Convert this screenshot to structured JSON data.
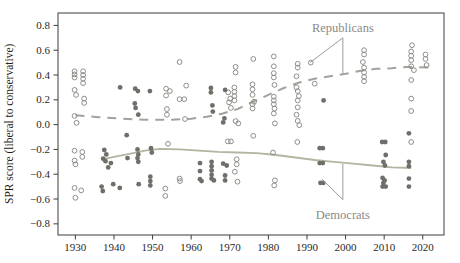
{
  "figure": {
    "background": "#ffffff"
  },
  "chart_data": {
    "type": "scatter",
    "title": "",
    "xlabel": "",
    "ylabel": "SPR score (liberal to conservative)",
    "xlim": [
      1925.5,
      2025.5
    ],
    "ylim": [
      -0.89,
      0.9
    ],
    "grid": false,
    "x_ticks": [
      1930,
      1940,
      1950,
      1960,
      1970,
      1980,
      1990,
      2000,
      2010,
      2020
    ],
    "x_tick_labels": [
      "1930",
      "1940",
      "1950",
      "1960",
      "1970",
      "1980",
      "1990",
      "2000",
      "2010",
      "2020"
    ],
    "y_ticks": [
      0.8,
      0.6,
      0.4,
      0.2,
      0.0,
      -0.2,
      -0.4,
      -0.6,
      -0.8
    ],
    "y_tick_labels": [
      "0.8",
      "0.6",
      "0.4",
      "0.2",
      "0.0",
      "−0.2",
      "−0.4",
      "−0.6",
      "−0.8"
    ],
    "colors": {
      "frame": "#3c3c3a",
      "tick_text": "#2a2a28",
      "republican_marker": "#8e8e89",
      "democrat_marker": "#6f6f69",
      "republican_trend": "#a2a29c",
      "democrat_trend": "#b2b5a1",
      "annotation_text": "#8a8a84",
      "leader_line": "#9b9b96"
    },
    "series": [
      {
        "name": "Republicans",
        "marker": "open-circle",
        "trend_style": "dashed",
        "points": [
          [
            1929.8,
            0.43
          ],
          [
            1929.8,
            0.405
          ],
          [
            1929.8,
            0.38
          ],
          [
            1929.8,
            0.28
          ],
          [
            1930.2,
            0.24
          ],
          [
            1929.8,
            0.07
          ],
          [
            1930.3,
            0.015
          ],
          [
            1929.8,
            -0.21
          ],
          [
            1929.8,
            -0.29
          ],
          [
            1930.0,
            -0.32
          ],
          [
            1929.8,
            -0.51
          ],
          [
            1930.0,
            -0.59
          ],
          [
            1932.0,
            0.43
          ],
          [
            1932.0,
            0.4
          ],
          [
            1932.0,
            0.37
          ],
          [
            1932.0,
            0.335
          ],
          [
            1932.3,
            0.21
          ],
          [
            1932.3,
            0.175
          ],
          [
            1931.8,
            -0.22
          ],
          [
            1931.8,
            -0.26
          ],
          [
            1931.5,
            -0.53
          ],
          [
            1953.5,
            0.29
          ],
          [
            1954.5,
            0.27
          ],
          [
            1953.5,
            0.235
          ],
          [
            1953.7,
            0.125
          ],
          [
            1953.7,
            0.08
          ],
          [
            1954.0,
            -0.155
          ],
          [
            1953.3,
            -0.515
          ],
          [
            1953.3,
            -0.575
          ],
          [
            1957.0,
            0.505
          ],
          [
            1958.7,
            0.315
          ],
          [
            1957.0,
            0.205
          ],
          [
            1958.2,
            0.205
          ],
          [
            1958.4,
            0.045
          ],
          [
            1957.0,
            -0.435
          ],
          [
            1957.1,
            -0.455
          ],
          [
            1969.6,
            0.26
          ],
          [
            1970.1,
            0.21
          ],
          [
            1969.8,
            0.18
          ],
          [
            1970.3,
            0.135
          ],
          [
            1971.5,
            0.028
          ],
          [
            1969.5,
            -0.135
          ],
          [
            1970.3,
            -0.135
          ],
          [
            1971.5,
            0.465
          ],
          [
            1971.5,
            0.42
          ],
          [
            1971.2,
            0.3
          ],
          [
            1971.2,
            0.265
          ],
          [
            1971.2,
            0.23
          ],
          [
            1971.2,
            0.195
          ],
          [
            1972.2,
            0.01
          ],
          [
            1971.8,
            -0.28
          ],
          [
            1971.8,
            -0.32
          ],
          [
            1971.3,
            -0.38
          ],
          [
            1972.0,
            -0.46
          ],
          [
            1976.1,
            0.53
          ],
          [
            1975.9,
            0.325
          ],
          [
            1975.9,
            0.285
          ],
          [
            1975.9,
            0.24
          ],
          [
            1976.3,
            0.185
          ],
          [
            1975.9,
            0.165
          ],
          [
            1975.9,
            0.13
          ],
          [
            1976.1,
            -0.09
          ],
          [
            1981.4,
            0.55
          ],
          [
            1981.4,
            0.47
          ],
          [
            1981.4,
            0.415
          ],
          [
            1981.4,
            0.38
          ],
          [
            1981.6,
            0.32
          ],
          [
            1981.4,
            0.225
          ],
          [
            1981.4,
            0.195
          ],
          [
            1981.4,
            0.165
          ],
          [
            1981.6,
            0.13
          ],
          [
            1981.4,
            0.09
          ],
          [
            1981.7,
            0.01
          ],
          [
            1981.2,
            -0.225
          ],
          [
            1981.7,
            -0.45
          ],
          [
            1981.5,
            -0.49
          ],
          [
            1987.6,
            0.49
          ],
          [
            1987.6,
            0.46
          ],
          [
            1987.3,
            0.39
          ],
          [
            1987.3,
            0.3
          ],
          [
            1987.6,
            0.27
          ],
          [
            1987.9,
            0.23
          ],
          [
            1987.6,
            0.195
          ],
          [
            1987.6,
            0.14
          ],
          [
            1987.3,
            0.08
          ],
          [
            1987.6,
            0.03
          ],
          [
            1988.0,
            -0.005
          ],
          [
            1987.5,
            -0.14
          ],
          [
            1991.0,
            0.5
          ],
          [
            1992.0,
            0.33
          ],
          [
            2004.8,
            0.6
          ],
          [
            2004.8,
            0.565
          ],
          [
            2004.5,
            0.505
          ],
          [
            2004.8,
            0.46
          ],
          [
            2004.8,
            0.42
          ],
          [
            2004.8,
            0.385
          ],
          [
            2004.8,
            0.35
          ],
          [
            2017.2,
            0.64
          ],
          [
            2017.0,
            0.59
          ],
          [
            2017.0,
            0.555
          ],
          [
            2017.0,
            0.52
          ],
          [
            2017.0,
            0.47
          ],
          [
            2017.7,
            0.44
          ],
          [
            2017.0,
            0.36
          ],
          [
            2017.0,
            0.21
          ],
          [
            2017.0,
            0.11
          ],
          [
            2017.0,
            -0.14
          ],
          [
            2020.7,
            0.565
          ],
          [
            2020.7,
            0.53
          ],
          [
            2021.0,
            0.48
          ]
        ],
        "trend": [
          [
            1930,
            0.075
          ],
          [
            1936,
            0.06
          ],
          [
            1942,
            0.048
          ],
          [
            1948,
            0.04
          ],
          [
            1954,
            0.038
          ],
          [
            1960,
            0.048
          ],
          [
            1964,
            0.063
          ],
          [
            1968,
            0.088
          ],
          [
            1972,
            0.125
          ],
          [
            1976,
            0.185
          ],
          [
            1980,
            0.24
          ],
          [
            1984,
            0.295
          ],
          [
            1988,
            0.34
          ],
          [
            1992,
            0.37
          ],
          [
            1996,
            0.39
          ],
          [
            2000,
            0.41
          ],
          [
            2004,
            0.435
          ],
          [
            2008,
            0.45
          ],
          [
            2012,
            0.455
          ],
          [
            2016,
            0.465
          ],
          [
            2022,
            0.46
          ]
        ]
      },
      {
        "name": "Democrats",
        "marker": "filled-circle",
        "trend_style": "solid",
        "points": [
          [
            1937.5,
            -0.205
          ],
          [
            1938.0,
            -0.24
          ],
          [
            1937.2,
            -0.275
          ],
          [
            1937.8,
            -0.295
          ],
          [
            1939.2,
            -0.31
          ],
          [
            1938.5,
            -0.345
          ],
          [
            1936.8,
            -0.5
          ],
          [
            1937.1,
            -0.535
          ],
          [
            1939.8,
            -0.48
          ],
          [
            1941.6,
            0.3
          ],
          [
            1941.5,
            -0.51
          ],
          [
            1943.3,
            -0.085
          ],
          [
            1943.5,
            -0.27
          ],
          [
            1945.5,
            0.29
          ],
          [
            1946.2,
            0.27
          ],
          [
            1945.4,
            0.17
          ],
          [
            1945.6,
            0.135
          ],
          [
            1946.3,
            0.08
          ],
          [
            1946.1,
            -0.2
          ],
          [
            1946.3,
            -0.24
          ],
          [
            1946.1,
            -0.27
          ],
          [
            1946.3,
            -0.3
          ],
          [
            1946.4,
            -0.48
          ],
          [
            1949.3,
            0.27
          ],
          [
            1949.6,
            -0.19
          ],
          [
            1949.8,
            -0.225
          ],
          [
            1949.4,
            -0.42
          ],
          [
            1949.4,
            -0.455
          ],
          [
            1949.4,
            -0.49
          ],
          [
            1962.3,
            -0.31
          ],
          [
            1962.3,
            -0.375
          ],
          [
            1962.3,
            -0.44
          ],
          [
            1962.7,
            -0.455
          ],
          [
            1965.1,
            0.295
          ],
          [
            1965.1,
            0.26
          ],
          [
            1965.5,
            0.155
          ],
          [
            1965.6,
            0.105
          ],
          [
            1965.3,
            -0.3
          ],
          [
            1965.3,
            -0.335
          ],
          [
            1965.3,
            -0.37
          ],
          [
            1965.3,
            -0.405
          ],
          [
            1965.3,
            -0.435
          ],
          [
            1965.9,
            -0.45
          ],
          [
            1968.8,
            0.28
          ],
          [
            1968.6,
            0.05
          ],
          [
            1968.3,
            0.018
          ],
          [
            1968.3,
            -0.315
          ],
          [
            1969.2,
            -0.33
          ],
          [
            1968.8,
            -0.41
          ],
          [
            1968.8,
            -0.45
          ],
          [
            1994.3,
            0.195
          ],
          [
            1993.3,
            -0.19
          ],
          [
            1994.1,
            -0.19
          ],
          [
            1993.3,
            -0.31
          ],
          [
            1994.1,
            -0.31
          ],
          [
            1993.5,
            -0.47
          ],
          [
            1994.2,
            -0.47
          ],
          [
            2009.5,
            -0.14
          ],
          [
            2010.3,
            -0.14
          ],
          [
            2010.4,
            -0.245
          ],
          [
            2009.8,
            -0.3
          ],
          [
            2010.2,
            -0.33
          ],
          [
            2009.6,
            -0.43
          ],
          [
            2010.1,
            -0.45
          ],
          [
            2009.8,
            -0.47
          ],
          [
            2009.6,
            -0.5
          ],
          [
            2010.4,
            -0.5
          ],
          [
            2016.4,
            -0.07
          ],
          [
            2016.4,
            -0.3
          ],
          [
            2016.4,
            -0.335
          ],
          [
            2016.4,
            -0.435
          ],
          [
            2016.4,
            -0.5
          ]
        ],
        "trend": [
          [
            1937,
            -0.28
          ],
          [
            1940,
            -0.26
          ],
          [
            1944,
            -0.235
          ],
          [
            1948,
            -0.21
          ],
          [
            1952,
            -0.195
          ],
          [
            1957,
            -0.2
          ],
          [
            1962,
            -0.21
          ],
          [
            1967,
            -0.22
          ],
          [
            1972,
            -0.225
          ],
          [
            1977,
            -0.23
          ],
          [
            1982,
            -0.245
          ],
          [
            1987,
            -0.265
          ],
          [
            1992,
            -0.285
          ],
          [
            1997,
            -0.3
          ],
          [
            2002,
            -0.315
          ],
          [
            2007,
            -0.33
          ],
          [
            2012,
            -0.345
          ],
          [
            2017,
            -0.35
          ]
        ]
      }
    ],
    "annotations": [
      {
        "text": "Republicans",
        "name": "republicans-label",
        "tx": 1999.3,
        "ty": 0.78,
        "apex": [
          1999.3,
          0.7
        ],
        "targets": [
          [
            1990.8,
            0.5
          ],
          [
            1999.3,
            0.415
          ]
        ]
      },
      {
        "text": "Democrats",
        "name": "democrats-label",
        "tx": 1999.3,
        "ty": -0.725,
        "apex": [
          1999.3,
          -0.605
        ],
        "targets": [
          [
            1993.9,
            -0.44
          ],
          [
            1999.3,
            -0.315
          ]
        ]
      }
    ]
  }
}
